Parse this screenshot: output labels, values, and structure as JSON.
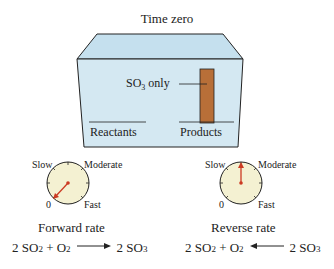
{
  "title": "Time zero",
  "container": {
    "fill_color": "#d4e8f2",
    "top_color": "#c5e0ee",
    "bar_color": "#b86f38",
    "bar_label_main": "SO",
    "bar_label_sub": "3",
    "bar_label_suffix": " only",
    "reactants_label": "Reactants",
    "products_label": "Products",
    "products_fraction": 1.0,
    "reactants_fraction": 0.0
  },
  "dials": [
    {
      "id": "forward",
      "labels": {
        "slow": "Slow",
        "moderate": "Moderate",
        "zero": "0",
        "fast": "Fast"
      },
      "reading": "0",
      "rate_label": "Forward rate",
      "equation": {
        "left": [
          "2 SO",
          "2",
          " + O",
          "2"
        ],
        "right": [
          "2 SO",
          "3"
        ],
        "direction": "forward"
      }
    },
    {
      "id": "reverse",
      "labels": {
        "slow": "Slow",
        "moderate": "Moderate",
        "zero": "0",
        "fast": "Fast"
      },
      "reading": "Moderate (top)",
      "rate_label": "Reverse rate",
      "equation": {
        "left": [
          "2 SO",
          "2",
          " + O",
          "2"
        ],
        "right": [
          "2 SO",
          "3"
        ],
        "direction": "reverse"
      }
    }
  ],
  "colors": {
    "dial_face": "#f4f1d2",
    "needle": "#cc3a22",
    "line": "#222222"
  }
}
